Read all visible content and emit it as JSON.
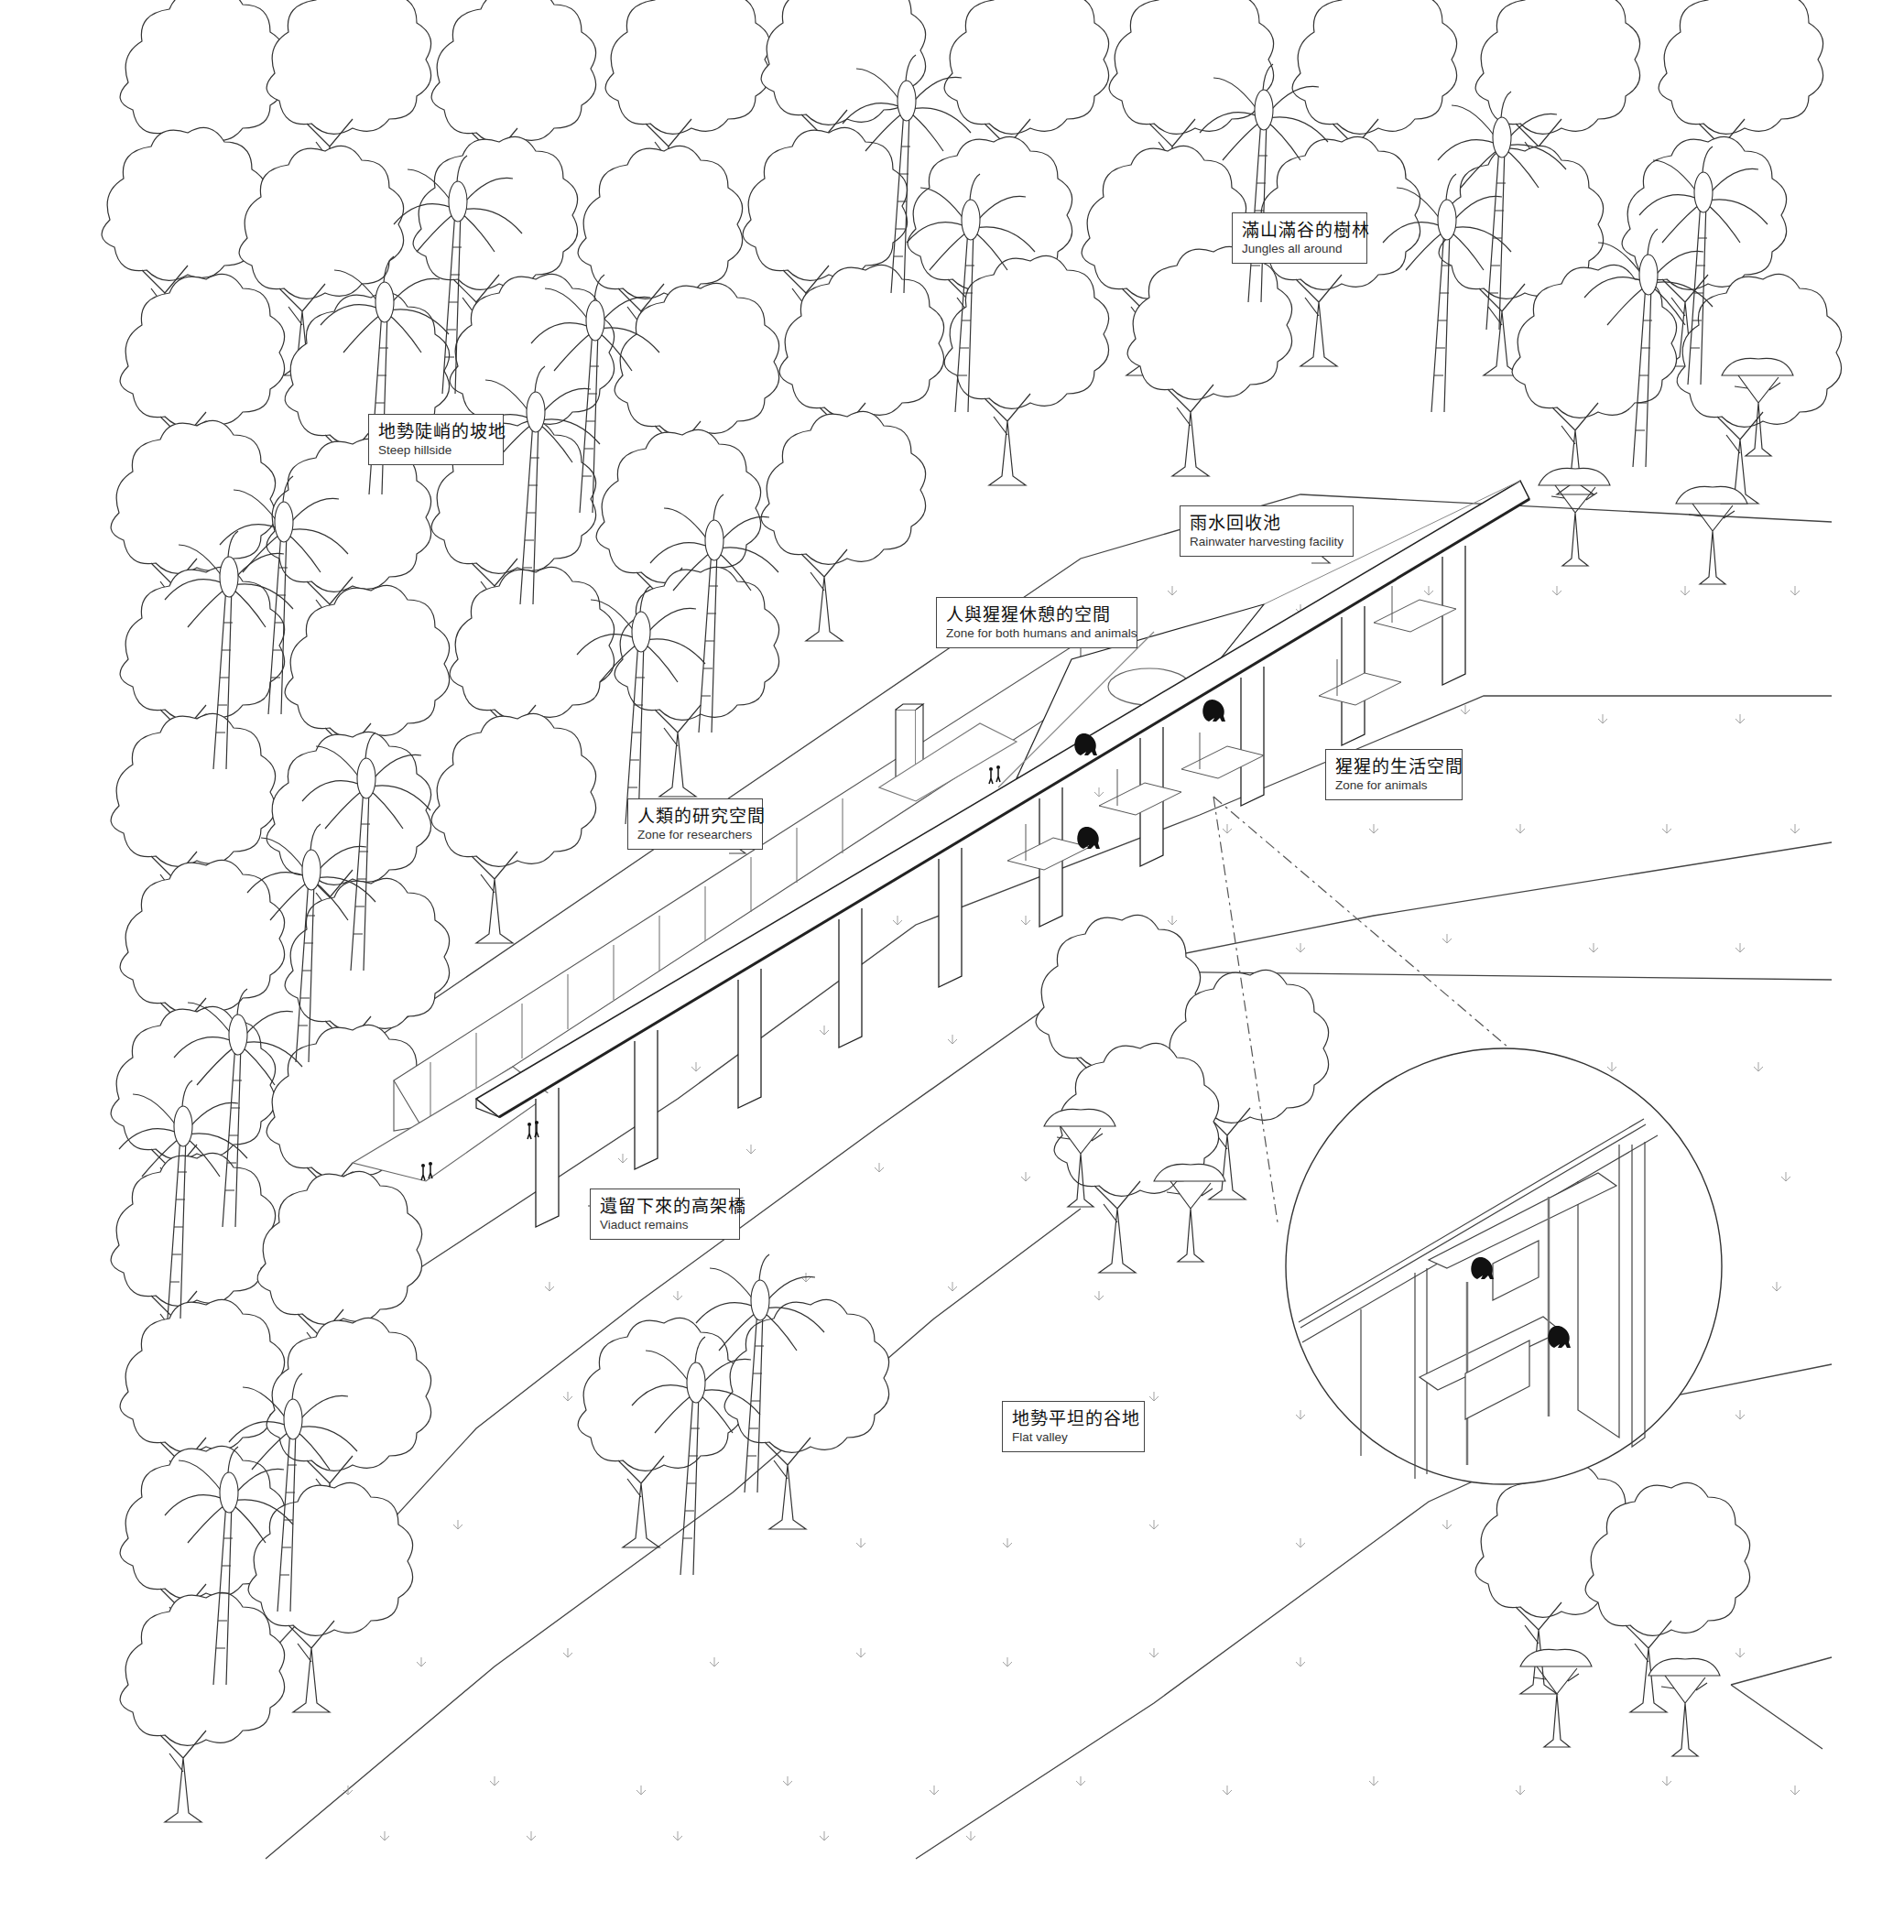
{
  "diagram": {
    "type": "architectural-axonometric",
    "style": {
      "line_color": "#333333",
      "background": "#ffffff",
      "silhouette_color": "#111111"
    }
  },
  "labels": {
    "jungle": {
      "zh": "滿山滿谷的樹林",
      "en": "Jungles all around"
    },
    "hillside": {
      "zh": "地勢陡峭的坡地",
      "en": "Steep hillside"
    },
    "rainwater": {
      "zh": "雨水回收池",
      "en": "Rainwater harvesting facility"
    },
    "shared_zone": {
      "zh": "人與猩猩休憩的空間",
      "en": "Zone for both humans and animals"
    },
    "animal_zone": {
      "zh": "猩猩的生活空間",
      "en": "Zone for animals"
    },
    "research_zone": {
      "zh": "人類的研究空間",
      "en": "Zone for researchers"
    },
    "viaduct": {
      "zh": "遺留下來的高架橋",
      "en": "Viaduct remains"
    },
    "valley": {
      "zh": "地勢平坦的谷地",
      "en": "Flat valley"
    }
  },
  "elements": {
    "viaduct_piers_count": 10,
    "detail_callout": "circular enlarged view of animal platforms hung below viaduct deck with two ape silhouettes",
    "human_figures": 4,
    "ape_silhouettes_main": 3,
    "ape_silhouettes_detail": 2
  }
}
